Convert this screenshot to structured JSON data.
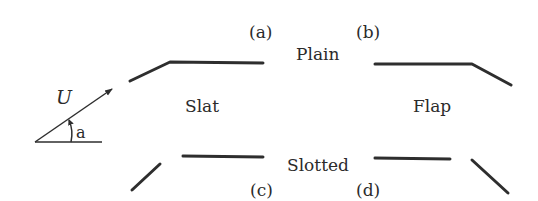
{
  "diagram": {
    "type": "airfoil high-lift devices schematic",
    "labels": {
      "a": "(a)",
      "b": "(b)",
      "c": "(c)",
      "d": "(d)",
      "plain": "Plain",
      "slotted": "Slotted",
      "slat": "Slat",
      "flap": "Flap",
      "velocity": "U",
      "angle": "a"
    },
    "colors": {
      "line": "#2e2e2e",
      "text": "#2b2b2b",
      "background": "#ffffff"
    }
  }
}
